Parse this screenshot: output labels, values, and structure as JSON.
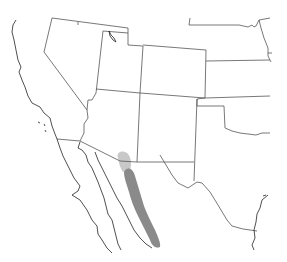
{
  "map": {
    "type": "species-range-map",
    "region": "Southwestern United States and Northwestern Mexico",
    "background": "#ffffff",
    "colors": {
      "state_border": "#555555",
      "coastline": "#222222",
      "range_primary": "#8a8a8a",
      "range_secondary": "#c8c8c8"
    },
    "layers": [
      {
        "name": "state-borders",
        "visible": true
      },
      {
        "name": "coastline",
        "visible": true
      },
      {
        "name": "range-secondary",
        "description": "light grey area near Arizona–Sonora border",
        "visible": true
      },
      {
        "name": "range-primary",
        "description": "dark grey band through Sonora, Mexico",
        "visible": true
      }
    ]
  }
}
